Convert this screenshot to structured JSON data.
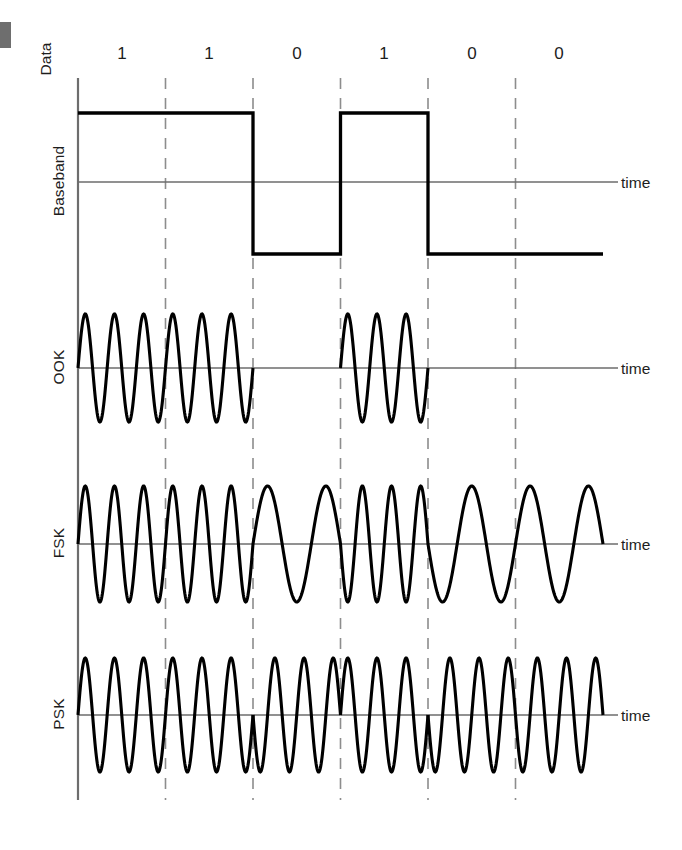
{
  "figure": {
    "data_row_label": "Data",
    "bits": [
      "1",
      "1",
      "0",
      "1",
      "0",
      "0"
    ],
    "time_axis_label": "time",
    "rows": [
      {
        "label": "Baseband",
        "time_label": "time"
      },
      {
        "label": "OOK",
        "time_label": "time"
      },
      {
        "label": "FSK",
        "time_label": "time"
      },
      {
        "label": "PSK",
        "time_label": "time"
      }
    ],
    "colors": {
      "wave": "#000000",
      "axis": "#6d6d6d",
      "grid": "#8d8d8d",
      "text": "#1d1d1d",
      "edge_mark": "#6e6e6e",
      "background": "#ffffff"
    }
  },
  "chart_data": {
    "type": "line",
    "xlabel": "time",
    "ylabel": "",
    "bit_sequence": [
      1,
      1,
      0,
      1,
      0,
      0
    ],
    "bit_count": 6,
    "geometry": {
      "origin_x": 78,
      "bit_width": 87.5,
      "plot_right": 604,
      "grid_x": [
        165.5,
        253,
        340.5,
        428,
        515.5
      ],
      "data_label_y": 58,
      "data_label_x": [
        122,
        209,
        297,
        384,
        472,
        559
      ]
    },
    "series": [
      {
        "name": "Baseband",
        "type": "square",
        "axis_y": 182,
        "high_y": 113,
        "low_y": 254,
        "top_y": 84,
        "bottom_y": 290,
        "levels": [
          1,
          1,
          0,
          1,
          0,
          0
        ],
        "description": "NRZ square wave: high for bit 1, low for bit 0"
      },
      {
        "name": "OOK",
        "type": "sine-gated",
        "axis_y": 368,
        "amplitude": 54,
        "top_y": 292,
        "bottom_y": 440,
        "cycles_per_bit": 3,
        "on_bits": [
          1,
          1,
          0,
          1,
          0,
          0
        ],
        "description": "On-off keying: carrier present for bit 1, zero amplitude for bit 0"
      },
      {
        "name": "FSK",
        "type": "sine-frequency",
        "axis_y": 544,
        "amplitude": 58,
        "top_y": 466,
        "bottom_y": 620,
        "cycles_per_bit_one": 3,
        "cycles_per_bit_zero": 1.5,
        "description": "Frequency shift keying: high frequency for bit 1, low frequency for bit 0"
      },
      {
        "name": "PSK",
        "type": "sine-phase",
        "axis_y": 715,
        "amplitude": 57,
        "top_y": 636,
        "bottom_y": 790,
        "cycles_per_bit": 3,
        "phase_per_bit_deg": [
          0,
          0,
          180,
          0,
          180,
          180
        ],
        "description": "Phase shift keying: constant amplitude and frequency, 180 degree phase reversal on bit change"
      }
    ],
    "grid": true,
    "legend": "none"
  }
}
